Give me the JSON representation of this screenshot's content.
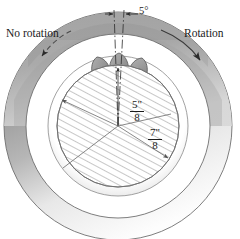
{
  "figure": {
    "background_color": "#ffffff",
    "labels": {
      "no_rotation": "No rotation",
      "rotation": "Rotation",
      "angle": "5°"
    },
    "dimensions": [
      {
        "id": "inner-diameter",
        "numerator": "5\"",
        "denominator": "8"
      },
      {
        "id": "outer-diameter",
        "numerator": "7\"",
        "denominator": "8"
      }
    ],
    "geometry": {
      "center_x": 118,
      "center_y": 126,
      "outer_ring_outer_radius": 114,
      "outer_ring_inner_radius": 92,
      "hatched_circle_radius": 61,
      "gap_ring_radius": 70,
      "droplet_count": 3,
      "angle_degrees": 5
    },
    "colors": {
      "line": "#2b2b2b",
      "ring_light": "#ffffff",
      "ring_mid": "#b9b9b9",
      "ring_dark": "#8e8e8e",
      "droplet_fill": "#9a9a9a",
      "hatch": "#8c8c8c",
      "text": "#1a1a1a"
    }
  }
}
